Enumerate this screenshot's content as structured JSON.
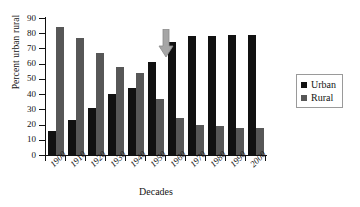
{
  "chart_data": {
    "type": "bar",
    "title": "",
    "xlabel": "Decades",
    "ylabel": "Percent urban rural",
    "categories": [
      "1900",
      "1910",
      "1920",
      "1930",
      "1940",
      "1950",
      "1960",
      "1970",
      "1980",
      "1990",
      "2000"
    ],
    "series": [
      {
        "name": "Urban",
        "color": "#111111",
        "values": [
          16,
          23,
          31,
          40,
          44,
          61,
          74,
          78,
          78,
          79,
          79
        ]
      },
      {
        "name": "Rural",
        "color": "#575757",
        "values": [
          84,
          77,
          67,
          58,
          54,
          37,
          24,
          20,
          19,
          18,
          18
        ]
      }
    ],
    "ylim": [
      0,
      90
    ],
    "yticks": [
      0,
      10,
      20,
      30,
      40,
      50,
      60,
      70,
      80,
      90
    ],
    "grid": false,
    "legend_position": "right",
    "annotations": [
      {
        "name": "down-arrow",
        "target": "between 1940 and 1950",
        "color": "#9e9e9e"
      }
    ]
  },
  "legend": {
    "entries": [
      {
        "label": "Urban",
        "color": "#111111"
      },
      {
        "label": "Rural",
        "color": "#575757"
      }
    ]
  }
}
